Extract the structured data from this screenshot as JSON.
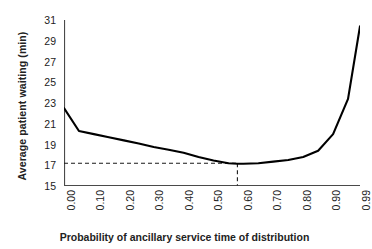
{
  "chart_data": {
    "type": "line",
    "title": "",
    "xlabel": "Probability of ancillary service time of distribution",
    "ylabel": "Average patient waiting (min)",
    "xlim": [
      0.0,
      0.99
    ],
    "ylim": [
      15,
      31
    ],
    "ytick_step": 2,
    "grid": false,
    "legend": "none",
    "line_color": "#000000",
    "x_tick_labels": [
      "0.00",
      "0.10",
      "0.20",
      "0.30",
      "0.40",
      "0.50",
      "0.60",
      "0.70",
      "0.80",
      "0.90",
      "0.99"
    ],
    "x_tick_values": [
      0.0,
      0.1,
      0.2,
      0.3,
      0.4,
      0.5,
      0.6,
      0.7,
      0.8,
      0.9,
      0.99
    ],
    "y_tick_labels": [
      "15",
      "17",
      "19",
      "21",
      "23",
      "25",
      "27",
      "29",
      "31"
    ],
    "y_tick_values": [
      15,
      17,
      19,
      21,
      23,
      25,
      27,
      29,
      31
    ],
    "x": [
      0.0,
      0.05,
      0.1,
      0.15,
      0.2,
      0.25,
      0.3,
      0.35,
      0.4,
      0.45,
      0.5,
      0.55,
      0.58,
      0.6,
      0.65,
      0.7,
      0.75,
      0.8,
      0.85,
      0.9,
      0.95,
      0.99
    ],
    "values": [
      22.5,
      20.3,
      20.0,
      19.7,
      19.4,
      19.1,
      18.75,
      18.5,
      18.2,
      17.8,
      17.45,
      17.2,
      17.15,
      17.15,
      17.2,
      17.35,
      17.5,
      17.8,
      18.4,
      20.0,
      23.4,
      30.4
    ],
    "series": [
      {
        "name": "Average patient waiting",
        "values": [
          22.5,
          20.3,
          20.0,
          19.7,
          19.4,
          19.1,
          18.75,
          18.5,
          18.2,
          17.8,
          17.45,
          17.2,
          17.15,
          17.15,
          17.2,
          17.35,
          17.5,
          17.8,
          18.4,
          20.0,
          23.4,
          30.4
        ]
      }
    ],
    "annotations": [
      {
        "name": "optimum-guide-horizontal",
        "type": "dashed-line",
        "orientation": "horizontal",
        "y": 17.2,
        "x_from": 0.0,
        "x_to": 0.58
      },
      {
        "name": "optimum-guide-vertical",
        "type": "dashed-line",
        "orientation": "vertical",
        "x": 0.58,
        "y_from": 15.0,
        "y_to": 17.2
      }
    ]
  }
}
